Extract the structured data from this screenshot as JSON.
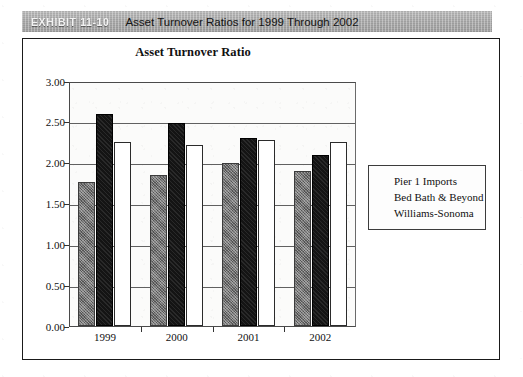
{
  "exhibit": {
    "number": "EXHIBIT 11-10",
    "title": "Asset Turnover Ratios for 1999 Through 2002"
  },
  "chart_data": {
    "type": "bar",
    "title": "Asset Turnover Ratio",
    "xlabel": "",
    "ylabel": "",
    "categories": [
      "1999",
      "2000",
      "2001",
      "2002"
    ],
    "series": [
      {
        "name": "Pier 1 Imports",
        "color": "#6e6e6e",
        "values": [
          1.76,
          1.85,
          2.0,
          1.9
        ]
      },
      {
        "name": "Bed Bath & Beyond",
        "color": "#141414",
        "values": [
          2.6,
          2.48,
          2.3,
          2.1
        ]
      },
      {
        "name": "Williams-Sonoma",
        "color": "#ffffff",
        "values": [
          2.25,
          2.22,
          2.28,
          2.25
        ]
      }
    ],
    "ylim": [
      0.0,
      3.0
    ],
    "ytick_labels": [
      "3.00",
      "2.50",
      "2.00",
      "1.50",
      "1.00",
      "0.50",
      "0.00"
    ],
    "ytick_values": [
      3.0,
      2.5,
      2.0,
      1.5,
      1.0,
      0.5,
      0.0
    ],
    "grid": true,
    "legend_position": "right"
  }
}
